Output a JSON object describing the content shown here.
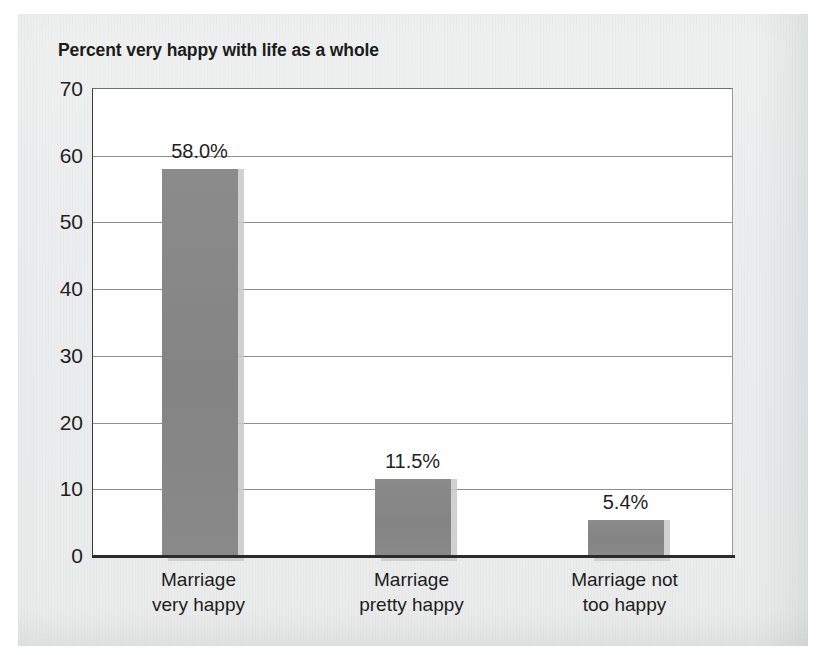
{
  "chart_data": {
    "type": "bar",
    "title": "Percent very happy with life as a whole",
    "xlabel": "",
    "ylabel": "",
    "ylim": [
      0,
      70
    ],
    "yticks": [
      "0",
      "10",
      "20",
      "30",
      "40",
      "50",
      "60",
      "70"
    ],
    "ytick_values": [
      0,
      10,
      20,
      30,
      40,
      50,
      60,
      70
    ],
    "grid": true,
    "legend": "none",
    "categories": [
      "Marriage\nvery happy",
      "Marriage\npretty happy",
      "Marriage not\ntoo happy"
    ],
    "category_lines": [
      [
        "Marriage",
        "very happy"
      ],
      [
        "Marriage",
        "pretty happy"
      ],
      [
        "Marriage not",
        "too happy"
      ]
    ],
    "values": [
      58.0,
      11.5,
      5.4
    ],
    "data_labels": [
      "58.0%",
      "11.5%",
      "5.4%"
    ],
    "bar_color": "#878787",
    "bar_shadow_color": "#c9c9c9",
    "plot_background": "#ffffff",
    "page_background": "#ecedee",
    "axis_color": "#2b2b2b",
    "gridline_color": "#8e8e8e",
    "text_color": "#1f1f1f"
  }
}
